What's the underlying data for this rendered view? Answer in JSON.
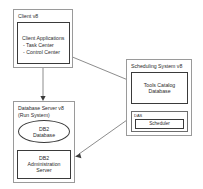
{
  "diagram": {
    "background_color": "#ffffff",
    "line_color": "#6f6f6f",
    "border_color": "#3a3a3a",
    "group_border_color": "#9a9a9a",
    "text_color": "#2b2b2b",
    "groups": {
      "client": {
        "title": "Client v8",
        "inner": {
          "heading": "Client Applications",
          "item_1": "- Task Center",
          "item_2": "- Control Center"
        }
      },
      "database_server": {
        "title_line_1": "Database Server v8",
        "title_line_2": "(Run System)",
        "db_ellipse_line_1": "DB2",
        "db_ellipse_line_2": "Database",
        "admin_line_1": "DB2",
        "admin_line_2": "Administration",
        "admin_line_3": "Server"
      },
      "scheduling_system": {
        "title": "Scheduling System v8",
        "catalog_line_1": "Tools Catalog",
        "catalog_line_2": "Database",
        "das_label": "DAS",
        "scheduler_label": "Scheduler"
      }
    },
    "connections": [
      {
        "name": "client-to-database-server",
        "from": "Client Applications",
        "to": "Database Server v8",
        "direction": "down"
      },
      {
        "name": "client-to-tools-catalog",
        "from": "Client Applications",
        "to": "Tools Catalog Database",
        "direction": "diagonal-right-down"
      },
      {
        "name": "tools-catalog-to-das",
        "from": "Tools Catalog Database",
        "to": "DAS",
        "direction": "down"
      },
      {
        "name": "db2-database-to-admin-server",
        "from": "DB2 Database",
        "to": "DB2 Administration Server",
        "direction": "down"
      },
      {
        "name": "das-to-db2-admin-server",
        "from": "DAS",
        "to": "DB2 Administration Server",
        "direction": "diagonal-left-down"
      }
    ]
  }
}
